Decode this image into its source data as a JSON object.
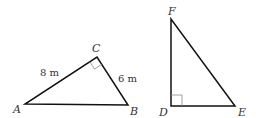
{
  "diagram": {
    "colors": {
      "stroke": "#111111",
      "right_angle_mark": "#888888",
      "text": "#333333"
    },
    "triangle_abc": {
      "vertices": {
        "A": {
          "label": "A",
          "x": 25,
          "y": 104
        },
        "B": {
          "label": "B",
          "x": 128,
          "y": 105
        },
        "C": {
          "label": "C",
          "x": 97,
          "y": 57
        }
      },
      "right_angle_at": "C",
      "side_labels": {
        "AC": "8 m",
        "CB": "6 m"
      }
    },
    "triangle_def": {
      "vertices": {
        "D": {
          "label": "D",
          "x": 171,
          "y": 106
        },
        "E": {
          "label": "E",
          "x": 235,
          "y": 106
        },
        "F": {
          "label": "F",
          "x": 171,
          "y": 19
        }
      },
      "right_angle_at": "D"
    }
  }
}
